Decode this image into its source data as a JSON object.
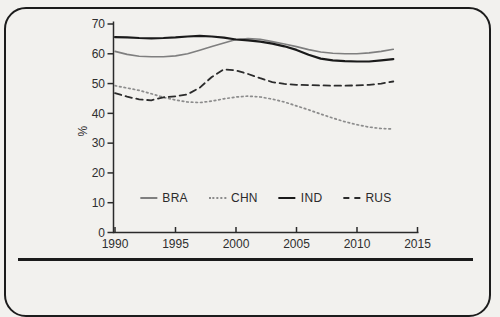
{
  "figure": {
    "background": "#f2f1ee",
    "frame_color": "#1c1c1c",
    "axis_color": "#2a2a2a",
    "text_color": "#2e2e2e"
  },
  "chart_data": {
    "type": "line",
    "title": "",
    "xlabel": "",
    "ylabel": "%",
    "xlim": [
      1990,
      2015
    ],
    "ylim": [
      0,
      70
    ],
    "x_ticks": [
      "1990",
      "1995",
      "2000",
      "2005",
      "2010",
      "2015"
    ],
    "y_ticks": [
      "0",
      "10",
      "20",
      "30",
      "40",
      "50",
      "60",
      "70"
    ],
    "grid": false,
    "legend_position": "lower center inside plot",
    "x": [
      1990,
      1991,
      1992,
      1993,
      1994,
      1995,
      1996,
      1997,
      1998,
      1999,
      2000,
      2001,
      2002,
      2003,
      2004,
      2005,
      2006,
      2007,
      2008,
      2009,
      2010,
      2011,
      2012,
      2013
    ],
    "series": [
      {
        "name": "BRA",
        "style": "solid",
        "color": "#7f7f7f",
        "width": 1.6,
        "values": [
          60.8,
          59.8,
          59.2,
          59.0,
          59.0,
          59.3,
          60.0,
          61.2,
          62.4,
          63.6,
          64.8,
          65.1,
          64.9,
          64.1,
          63.3,
          62.4,
          61.4,
          60.6,
          60.2,
          60.0,
          60.0,
          60.3,
          60.8,
          61.5
        ]
      },
      {
        "name": "CHN",
        "style": "dotted",
        "color": "#8c8c8c",
        "width": 1.7,
        "values": [
          49.3,
          48.5,
          47.7,
          46.6,
          45.4,
          44.5,
          43.8,
          43.6,
          44.1,
          44.9,
          45.5,
          45.8,
          45.5,
          44.8,
          43.8,
          42.5,
          41.2,
          39.8,
          38.4,
          37.2,
          36.2,
          35.4,
          34.9,
          34.7
        ]
      },
      {
        "name": "IND",
        "style": "solid",
        "color": "#1a1a1a",
        "width": 2.2,
        "values": [
          65.6,
          65.5,
          65.3,
          65.2,
          65.3,
          65.5,
          65.8,
          66.0,
          65.8,
          65.4,
          64.8,
          64.5,
          64.1,
          63.4,
          62.5,
          61.3,
          59.7,
          58.4,
          57.8,
          57.5,
          57.4,
          57.4,
          57.8,
          58.2
        ]
      },
      {
        "name": "RUS",
        "style": "dashed",
        "color": "#2b2b2b",
        "width": 1.8,
        "values": [
          46.8,
          45.6,
          44.7,
          44.4,
          45.4,
          45.7,
          46.4,
          48.6,
          52.2,
          54.8,
          54.4,
          53.2,
          51.8,
          50.5,
          49.9,
          49.6,
          49.5,
          49.4,
          49.3,
          49.3,
          49.4,
          49.6,
          50.0,
          50.7
        ]
      }
    ]
  }
}
